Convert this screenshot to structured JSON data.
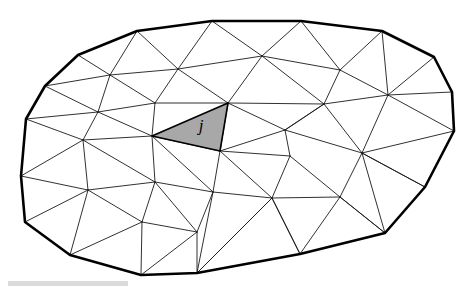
{
  "figure": {
    "kind": "mesh-diagram",
    "background_color": "#ffffff",
    "boundary_color": "#000000",
    "edge_color": "#1a1a1a",
    "shaded_element_fill": "#a8a8a8",
    "shaded_element_stroke": "#000000",
    "label_color": "#000000",
    "width": 472,
    "height": 289
  },
  "labels": {
    "element_j": "j"
  },
  "label_positions": {
    "element_j": {
      "x": 201,
      "y": 131
    }
  },
  "shaded_element": {
    "name": "j",
    "vertices": [
      [
        152,
        136
      ],
      [
        228,
        103
      ],
      [
        220,
        151
      ]
    ]
  },
  "boundary_polygon": [
    [
      78,
      55
    ],
    [
      137,
      31
    ],
    [
      212,
      21
    ],
    [
      301,
      21
    ],
    [
      382,
      31
    ],
    [
      434,
      57
    ],
    [
      452,
      92
    ],
    [
      454,
      131
    ],
    [
      425,
      187
    ],
    [
      385,
      233
    ],
    [
      300,
      254
    ],
    [
      197,
      273
    ],
    [
      141,
      275
    ],
    [
      70,
      255
    ],
    [
      25,
      222
    ],
    [
      21,
      176
    ],
    [
      26,
      119
    ],
    [
      45,
      86
    ]
  ],
  "interior_nodes": [
    [
      110,
      75
    ],
    [
      178,
      69
    ],
    [
      262,
      56
    ],
    [
      340,
      70
    ],
    [
      98,
      112
    ],
    [
      155,
      103
    ],
    [
      228,
      103
    ],
    [
      324,
      104
    ],
    [
      388,
      95
    ],
    [
      83,
      140
    ],
    [
      152,
      136
    ],
    [
      220,
      151
    ],
    [
      285,
      130
    ],
    [
      362,
      153
    ],
    [
      88,
      190
    ],
    [
      155,
      182
    ],
    [
      213,
      192
    ],
    [
      290,
      156
    ],
    [
      272,
      198
    ],
    [
      340,
      197
    ],
    [
      142,
      222
    ],
    [
      197,
      232
    ]
  ],
  "edges": [
    [
      [
        78,
        55
      ],
      [
        110,
        75
      ]
    ],
    [
      [
        78,
        55
      ],
      [
        45,
        86
      ]
    ],
    [
      [
        137,
        31
      ],
      [
        110,
        75
      ]
    ],
    [
      [
        137,
        31
      ],
      [
        178,
        69
      ]
    ],
    [
      [
        212,
        21
      ],
      [
        178,
        69
      ]
    ],
    [
      [
        212,
        21
      ],
      [
        262,
        56
      ]
    ],
    [
      [
        301,
        21
      ],
      [
        262,
        56
      ]
    ],
    [
      [
        301,
        21
      ],
      [
        340,
        70
      ]
    ],
    [
      [
        382,
        31
      ],
      [
        340,
        70
      ]
    ],
    [
      [
        382,
        31
      ],
      [
        388,
        95
      ]
    ],
    [
      [
        434,
        57
      ],
      [
        388,
        95
      ]
    ],
    [
      [
        452,
        92
      ],
      [
        388,
        95
      ]
    ],
    [
      [
        454,
        131
      ],
      [
        388,
        95
      ]
    ],
    [
      [
        454,
        131
      ],
      [
        362,
        153
      ]
    ],
    [
      [
        425,
        187
      ],
      [
        362,
        153
      ]
    ],
    [
      [
        385,
        233
      ],
      [
        362,
        153
      ]
    ],
    [
      [
        385,
        233
      ],
      [
        340,
        197
      ]
    ],
    [
      [
        300,
        254
      ],
      [
        340,
        197
      ]
    ],
    [
      [
        300,
        254
      ],
      [
        272,
        198
      ]
    ],
    [
      [
        197,
        273
      ],
      [
        272,
        198
      ]
    ],
    [
      [
        197,
        273
      ],
      [
        197,
        232
      ]
    ],
    [
      [
        141,
        275
      ],
      [
        197,
        232
      ]
    ],
    [
      [
        141,
        275
      ],
      [
        142,
        222
      ]
    ],
    [
      [
        70,
        255
      ],
      [
        142,
        222
      ]
    ],
    [
      [
        70,
        255
      ],
      [
        88,
        190
      ]
    ],
    [
      [
        25,
        222
      ],
      [
        88,
        190
      ]
    ],
    [
      [
        21,
        176
      ],
      [
        88,
        190
      ]
    ],
    [
      [
        21,
        176
      ],
      [
        83,
        140
      ]
    ],
    [
      [
        26,
        119
      ],
      [
        83,
        140
      ]
    ],
    [
      [
        26,
        119
      ],
      [
        98,
        112
      ]
    ],
    [
      [
        45,
        86
      ],
      [
        98,
        112
      ]
    ],
    [
      [
        45,
        86
      ],
      [
        110,
        75
      ]
    ],
    [
      [
        110,
        75
      ],
      [
        178,
        69
      ]
    ],
    [
      [
        178,
        69
      ],
      [
        262,
        56
      ]
    ],
    [
      [
        262,
        56
      ],
      [
        340,
        70
      ]
    ],
    [
      [
        110,
        75
      ],
      [
        98,
        112
      ]
    ],
    [
      [
        110,
        75
      ],
      [
        155,
        103
      ]
    ],
    [
      [
        178,
        69
      ],
      [
        155,
        103
      ]
    ],
    [
      [
        178,
        69
      ],
      [
        228,
        103
      ]
    ],
    [
      [
        262,
        56
      ],
      [
        228,
        103
      ]
    ],
    [
      [
        262,
        56
      ],
      [
        324,
        104
      ]
    ],
    [
      [
        340,
        70
      ],
      [
        324,
        104
      ]
    ],
    [
      [
        340,
        70
      ],
      [
        388,
        95
      ]
    ],
    [
      [
        98,
        112
      ],
      [
        155,
        103
      ]
    ],
    [
      [
        155,
        103
      ],
      [
        228,
        103
      ]
    ],
    [
      [
        228,
        103
      ],
      [
        324,
        104
      ]
    ],
    [
      [
        324,
        104
      ],
      [
        388,
        95
      ]
    ],
    [
      [
        98,
        112
      ],
      [
        83,
        140
      ]
    ],
    [
      [
        98,
        112
      ],
      [
        152,
        136
      ]
    ],
    [
      [
        155,
        103
      ],
      [
        152,
        136
      ]
    ],
    [
      [
        228,
        103
      ],
      [
        220,
        151
      ]
    ],
    [
      [
        324,
        104
      ],
      [
        285,
        130
      ]
    ],
    [
      [
        324,
        104
      ],
      [
        362,
        153
      ]
    ],
    [
      [
        388,
        95
      ],
      [
        362,
        153
      ]
    ],
    [
      [
        83,
        140
      ],
      [
        152,
        136
      ]
    ],
    [
      [
        152,
        136
      ],
      [
        220,
        151
      ]
    ],
    [
      [
        220,
        151
      ],
      [
        285,
        130
      ]
    ],
    [
      [
        285,
        130
      ],
      [
        362,
        153
      ]
    ],
    [
      [
        83,
        140
      ],
      [
        88,
        190
      ]
    ],
    [
      [
        83,
        140
      ],
      [
        155,
        182
      ]
    ],
    [
      [
        152,
        136
      ],
      [
        155,
        182
      ]
    ],
    [
      [
        152,
        136
      ],
      [
        213,
        192
      ]
    ],
    [
      [
        220,
        151
      ],
      [
        213,
        192
      ]
    ],
    [
      [
        220,
        151
      ],
      [
        290,
        156
      ]
    ],
    [
      [
        285,
        130
      ],
      [
        290,
        156
      ]
    ],
    [
      [
        290,
        156
      ],
      [
        340,
        197
      ]
    ],
    [
      [
        362,
        153
      ],
      [
        340,
        197
      ]
    ],
    [
      [
        88,
        190
      ],
      [
        155,
        182
      ]
    ],
    [
      [
        155,
        182
      ],
      [
        213,
        192
      ]
    ],
    [
      [
        213,
        192
      ],
      [
        272,
        198
      ]
    ],
    [
      [
        272,
        198
      ],
      [
        340,
        197
      ]
    ],
    [
      [
        290,
        156
      ],
      [
        272,
        198
      ]
    ],
    [
      [
        88,
        190
      ],
      [
        142,
        222
      ]
    ],
    [
      [
        155,
        182
      ],
      [
        142,
        222
      ]
    ],
    [
      [
        155,
        182
      ],
      [
        197,
        232
      ]
    ],
    [
      [
        213,
        192
      ],
      [
        197,
        232
      ]
    ],
    [
      [
        213,
        192
      ],
      [
        197,
        273
      ]
    ],
    [
      [
        272,
        198
      ],
      [
        300,
        254
      ]
    ],
    [
      [
        272,
        198
      ],
      [
        197,
        273
      ]
    ],
    [
      [
        142,
        222
      ],
      [
        197,
        232
      ]
    ],
    [
      [
        340,
        197
      ],
      [
        385,
        233
      ]
    ],
    [
      [
        362,
        153
      ],
      [
        425,
        187
      ]
    ],
    [
      [
        324,
        104
      ],
      [
        285,
        130
      ]
    ],
    [
      [
        285,
        130
      ],
      [
        228,
        103
      ]
    ],
    [
      [
        220,
        151
      ],
      [
        272,
        198
      ]
    ]
  ],
  "smudges": [
    {
      "x": 8,
      "y": 281,
      "width": 120,
      "height": 5
    }
  ]
}
